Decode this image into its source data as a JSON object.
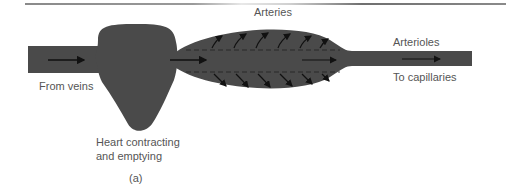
{
  "figure": {
    "caption": "(a)",
    "labels": {
      "arteries": "Arteries",
      "arterioles": "Arterioles",
      "from_veins": "From veins",
      "to_capillaries": "To capillaries",
      "heart_line1": "Heart contracting",
      "heart_line2": "and emptying"
    },
    "colors": {
      "vessel_fill": "#4a4a4a",
      "arrow": "#111111",
      "text": "#555555",
      "rule": "#8a8a8a"
    }
  }
}
